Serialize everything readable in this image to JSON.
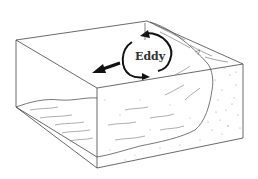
{
  "diagram": {
    "type": "block-diagram",
    "labels": {
      "eddy": "Eddy"
    },
    "colors": {
      "line": "#333333",
      "arrow": "#111111",
      "background": "#ffffff",
      "stipple": "#8a8a8a"
    }
  }
}
